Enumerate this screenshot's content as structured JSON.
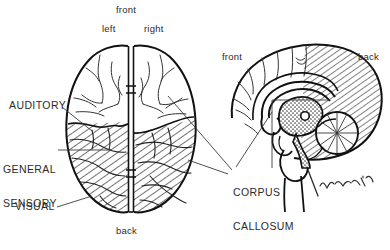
{
  "figure": {
    "views": {
      "dorsal": {
        "name": "dorsal-view",
        "description": "Top view of cerebrum with two hemispheres"
      },
      "sagittal": {
        "name": "sagittal-view",
        "description": "Midsagittal section of brain"
      }
    },
    "colors": {
      "ink": "#1a1a1a",
      "text": "#2b2b2b",
      "background": "#ffffff",
      "hatch": "#333333",
      "stipple": "#555555"
    }
  },
  "labels": {
    "front_top": "front",
    "left": "left",
    "right": "right",
    "auditory": "AUDITORY",
    "general_sensory_line1": "GENERAL",
    "general_sensory_line2": "SENSORY",
    "visual": "VISUAL",
    "back_bottom": "back",
    "corpus_line1": "CORPUS",
    "corpus_line2": "CALLOSUM",
    "front_sagittal": "front",
    "back_sagittal": "back",
    "signature": "artist signature '82"
  }
}
